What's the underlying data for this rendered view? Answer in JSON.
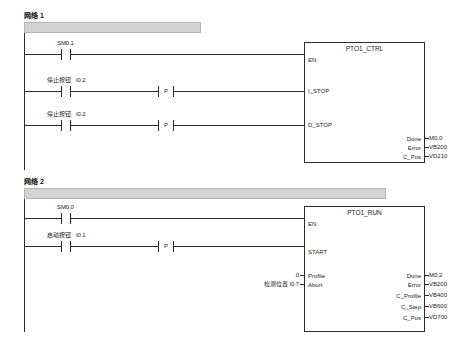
{
  "editor": {
    "type": "ladder-logic-lad-editor",
    "background": "#ffffff",
    "line_color": "#2b2b2b",
    "network_bar_color": "#d3d3d3"
  },
  "networks": [
    {
      "id": "network-1",
      "title": "网络 1",
      "comment": "",
      "rungs": [
        {
          "id": "rung-1-1",
          "contacts": [
            {
              "type": "no-contact",
              "label": "",
              "address": "SM0.1"
            }
          ],
          "edge_detect": null,
          "target_pin": "EN"
        },
        {
          "id": "rung-1-2",
          "contacts": [
            {
              "type": "no-contact",
              "label": "停止按钮",
              "address": "I0.2"
            }
          ],
          "edge_detect": "P",
          "target_pin": "I_STOP"
        },
        {
          "id": "rung-1-3",
          "contacts": [
            {
              "type": "no-contact",
              "label": "停止按钮",
              "address": "I0.2"
            }
          ],
          "edge_detect": "P",
          "target_pin": "D_STOP"
        }
      ],
      "block": {
        "name": "PTO1_CTRL",
        "inputs": [
          {
            "pin": "EN",
            "operand": ""
          },
          {
            "pin": "I_STOP",
            "operand": ""
          },
          {
            "pin": "D_STOP",
            "operand": ""
          }
        ],
        "outputs": [
          {
            "pin": "Done",
            "operand": "M0.0"
          },
          {
            "pin": "Error",
            "operand": "VB200"
          },
          {
            "pin": "C_Pos",
            "operand": "VD210"
          }
        ]
      }
    },
    {
      "id": "network-2",
      "title": "网络 2",
      "comment": "",
      "rungs": [
        {
          "id": "rung-2-1",
          "contacts": [
            {
              "type": "no-contact",
              "label": "",
              "address": "SM0.0"
            }
          ],
          "edge_detect": null,
          "target_pin": "EN"
        },
        {
          "id": "rung-2-2",
          "contacts": [
            {
              "type": "no-contact",
              "label": "启动按钮",
              "address": "I0.1"
            }
          ],
          "edge_detect": "P",
          "target_pin": "START"
        }
      ],
      "block": {
        "name": "PTO1_RUN",
        "inputs": [
          {
            "pin": "EN",
            "operand": ""
          },
          {
            "pin": "START",
            "operand": ""
          },
          {
            "pin": "Profile",
            "operand": "0"
          },
          {
            "pin": "Abort",
            "operand": "检测位置 I0.7"
          }
        ],
        "outputs": [
          {
            "pin": "Done",
            "operand": "M0.2"
          },
          {
            "pin": "Error",
            "operand": "VB200"
          },
          {
            "pin": "C_Profile",
            "operand": "VB400"
          },
          {
            "pin": "C_Step",
            "operand": "VB600"
          },
          {
            "pin": "C_Pos",
            "operand": "VD700"
          }
        ]
      }
    }
  ]
}
